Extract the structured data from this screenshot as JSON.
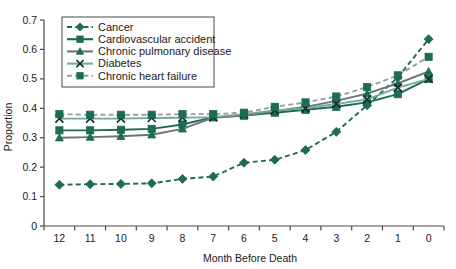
{
  "chart_data": {
    "type": "line",
    "title": "",
    "xlabel": "Month Before Death",
    "ylabel": "Proportion",
    "categories": [
      "12",
      "11",
      "10",
      "9",
      "8",
      "7",
      "6",
      "5",
      "4",
      "3",
      "2",
      "1",
      "0"
    ],
    "x": [
      12,
      11,
      10,
      9,
      8,
      7,
      6,
      5,
      4,
      3,
      2,
      1,
      0
    ],
    "ylim": [
      0,
      0.7
    ],
    "yticks": [
      0,
      0.1,
      0.2,
      0.3,
      0.4,
      0.5,
      0.6,
      0.7
    ],
    "ytick_labels": [
      "0",
      "0.1",
      "0.2",
      "0.3",
      "0.4",
      "0.5",
      "0.6",
      "0.7"
    ],
    "grid": false,
    "legend_position": "upper-left",
    "series": [
      {
        "name": "Cancer",
        "marker": "diamond",
        "linestyle": "dashed",
        "color": "#1b6b55",
        "values": [
          0.14,
          0.142,
          0.143,
          0.145,
          0.16,
          0.168,
          0.215,
          0.225,
          0.258,
          0.32,
          0.41,
          0.505,
          0.635
        ]
      },
      {
        "name": "Cardiovascular accident",
        "marker": "square",
        "linestyle": "solid",
        "color": "#1b6b55",
        "values": [
          0.325,
          0.325,
          0.327,
          0.33,
          0.345,
          0.37,
          0.375,
          0.385,
          0.395,
          0.405,
          0.42,
          0.448,
          0.5
        ]
      },
      {
        "name": "Chronic pulmonary disease",
        "marker": "triangle",
        "linestyle": "solid",
        "color": "#6f7276",
        "values": [
          0.3,
          0.302,
          0.305,
          0.31,
          0.33,
          0.368,
          0.375,
          0.39,
          0.405,
          0.425,
          0.45,
          0.485,
          0.525
        ]
      },
      {
        "name": "Diabetes",
        "marker": "cross",
        "linestyle": "solid",
        "color": "#6fada0",
        "values": [
          0.365,
          0.365,
          0.365,
          0.367,
          0.368,
          0.37,
          0.38,
          0.393,
          0.4,
          0.415,
          0.43,
          0.47,
          0.5
        ]
      },
      {
        "name": "Chronic heart failure",
        "marker": "square",
        "linestyle": "dashed",
        "color": "#9a9ea2",
        "values": [
          0.38,
          0.378,
          0.378,
          0.378,
          0.38,
          0.38,
          0.385,
          0.405,
          0.42,
          0.44,
          0.472,
          0.512,
          0.575
        ]
      }
    ]
  },
  "legend": {
    "items": [
      {
        "label": "Cancer"
      },
      {
        "label": "Cardiovascular accident"
      },
      {
        "label": "Chronic pulmonary disease"
      },
      {
        "label": "Diabetes"
      },
      {
        "label": "Chronic heart failure"
      }
    ]
  },
  "axes": {
    "y_title": "Proportion",
    "x_title": "Month Before Death"
  },
  "colors": {
    "accent_green": "#1b6b55",
    "grey": "#6f7276",
    "teal": "#6fada0",
    "light_grey": "#9a9ea2",
    "axis": "#4a4a4a",
    "background": "#ffffff"
  }
}
